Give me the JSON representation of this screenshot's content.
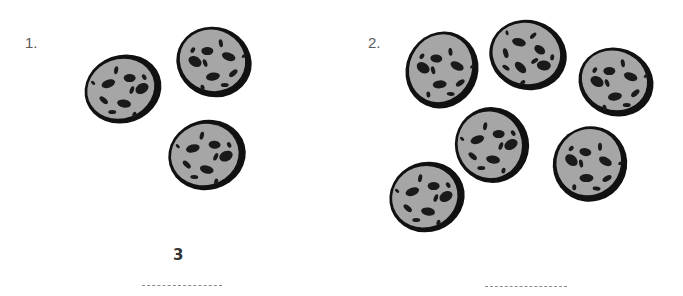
{
  "worksheet": {
    "problems": [
      {
        "number_label": "1.",
        "cookie_count": 3,
        "answer_text": "3",
        "answer_blank": ""
      },
      {
        "number_label": "2.",
        "cookie_count": 6,
        "answer_text": "",
        "answer_blank": ""
      }
    ]
  },
  "colors": {
    "cookie_fill": "#a6a6a6",
    "cookie_outline": "#111111",
    "chip": "#1a1a1a",
    "label_text": "#5a5a5a",
    "answer_text": "#333333"
  }
}
